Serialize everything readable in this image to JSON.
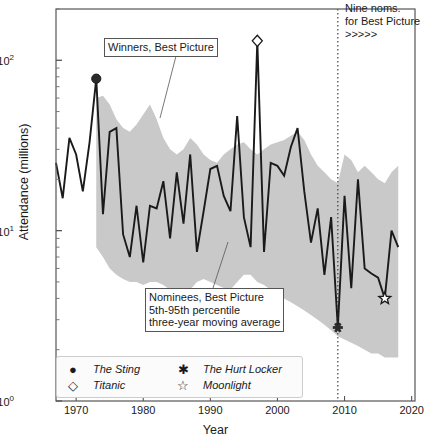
{
  "chart_data": {
    "type": "line",
    "title": "",
    "xlabel": "Year",
    "ylabel": "Attendance (millions)",
    "yscale": "log",
    "xlim": [
      1967,
      2020.5
    ],
    "ylim": [
      1,
      200
    ],
    "grid": false,
    "xticks": [
      1970,
      1980,
      1990,
      2000,
      2010,
      2020
    ],
    "xtick_labels": [
      "1970",
      "1980",
      "1990",
      "2000",
      "2010",
      "2020"
    ],
    "yticks": [
      1,
      10,
      100
    ],
    "ytick_labels": [
      "10^0",
      "10^1",
      "10^2"
    ],
    "series": [
      {
        "name": "Winners, Best Picture",
        "type": "line",
        "color": "#1a1a1a",
        "x": [
          1967,
          1968,
          1969,
          1970,
          1971,
          1972,
          1973,
          1974,
          1975,
          1976,
          1977,
          1978,
          1979,
          1980,
          1981,
          1982,
          1983,
          1984,
          1985,
          1986,
          1987,
          1988,
          1989,
          1990,
          1991,
          1992,
          1993,
          1994,
          1995,
          1996,
          1997,
          1998,
          1999,
          2000,
          2001,
          2002,
          2003,
          2004,
          2005,
          2006,
          2007,
          2008,
          2009,
          2010,
          2011,
          2012,
          2013,
          2014,
          2015,
          2016,
          2017,
          2018
        ],
        "values": [
          25.0,
          15.5,
          35.0,
          28.0,
          17.0,
          33.0,
          78.0,
          12.5,
          38.0,
          40.0,
          9.5,
          7.0,
          14.0,
          6.5,
          14.0,
          13.5,
          19.5,
          9.0,
          22.0,
          11.0,
          28.0,
          7.5,
          13.0,
          23.0,
          24.0,
          16.0,
          13.0,
          47.0,
          12.0,
          8.0,
          130.0,
          7.5,
          25.0,
          24.0,
          21.0,
          31.0,
          40.0,
          17.0,
          8.5,
          13.5,
          5.5,
          12.0,
          2.7,
          16.0,
          4.6,
          20.0,
          6.0,
          5.6,
          5.3,
          4.0,
          10.0,
          8.0
        ]
      },
      {
        "name": "Nominees, Best Picture 5th-95th percentile three-year moving average",
        "type": "band",
        "color": "#c9c9c9",
        "x": [
          1973,
          1974,
          1975,
          1976,
          1977,
          1978,
          1979,
          1980,
          1981,
          1982,
          1983,
          1984,
          1985,
          1986,
          1987,
          1988,
          1989,
          1990,
          1991,
          1992,
          1993,
          1994,
          1995,
          1996,
          1997,
          1998,
          1999,
          2000,
          2001,
          2002,
          2003,
          2004,
          2005,
          2006,
          2007,
          2008,
          2009,
          2010,
          2011,
          2012,
          2013,
          2014,
          2015,
          2016,
          2017,
          2018
        ],
        "lower": [
          8.0,
          7.0,
          6.0,
          5.5,
          5.2,
          5.0,
          5.0,
          4.8,
          5.0,
          5.0,
          4.8,
          4.5,
          4.2,
          4.0,
          4.5,
          5.0,
          5.2,
          5.0,
          4.8,
          4.6,
          4.5,
          5.0,
          5.5,
          5.5,
          5.0,
          4.8,
          4.5,
          4.2,
          4.0,
          3.8,
          3.6,
          3.4,
          3.2,
          3.0,
          2.8,
          2.6,
          2.4,
          2.3,
          2.2,
          2.1,
          2.0,
          1.9,
          1.9,
          1.8,
          1.8,
          1.8
        ],
        "upper": [
          60.0,
          62.0,
          55.0,
          45.0,
          40.0,
          38.0,
          42.0,
          48.0,
          55.0,
          45.0,
          35.0,
          30.0,
          28.0,
          30.0,
          35.0,
          32.0,
          28.0,
          26.0,
          25.0,
          28.0,
          30.0,
          32.0,
          33.0,
          30.0,
          28.0,
          30.0,
          32.0,
          33.0,
          34.0,
          36.0,
          38.0,
          34.0,
          28.0,
          24.0,
          22.0,
          20.0,
          19.0,
          28.0,
          26.0,
          22.0,
          24.0,
          22.0,
          20.0,
          19.0,
          22.0,
          24.0
        ]
      }
    ],
    "markers": [
      {
        "name": "The Sting",
        "glyph": "filled-circle",
        "x": 1973,
        "y": 78.0
      },
      {
        "name": "Titanic",
        "glyph": "open-diamond",
        "x": 1997,
        "y": 130.0
      },
      {
        "name": "The Hurt Locker",
        "glyph": "asterisk",
        "x": 2009,
        "y": 2.7
      },
      {
        "name": "Moonlight",
        "glyph": "open-star",
        "x": 2016,
        "y": 4.0
      }
    ],
    "annotations": [
      {
        "name": "winners-label",
        "text": "Winners, Best Picture",
        "x": 1984,
        "y": 75
      },
      {
        "name": "nominees-label",
        "text": "Nominees, Best Picture\n5th-95th percentile\nthree-year moving average",
        "x": 1991,
        "y": 3.3
      },
      {
        "name": "nine-noms-label",
        "text": "Nine noms.\nfor Best Picture\n>>>>>",
        "x": 2010,
        "y": 170
      }
    ],
    "vline": {
      "name": "nine-noms-vline",
      "x": 2009,
      "style": "dotted",
      "color": "#333333"
    },
    "legend": {
      "position": "lower-left-inside",
      "entries": [
        {
          "label": "The Sting",
          "glyph": "filled-circle"
        },
        {
          "label": "Titanic",
          "glyph": "open-diamond"
        },
        {
          "label": "The Hurt Locker",
          "glyph": "asterisk"
        },
        {
          "label": "Moonlight",
          "glyph": "open-star"
        }
      ]
    },
    "colors": {
      "line": "#1a1a1a",
      "band": "#c9c9c9",
      "axis": "#555555",
      "text": "#1a1a1a"
    }
  }
}
